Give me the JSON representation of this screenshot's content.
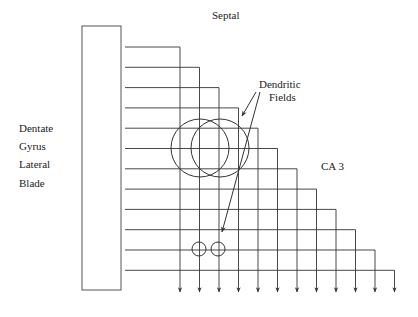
{
  "labels": {
    "septal": "Septal",
    "dentate": "Dentate",
    "gyrus": "Gyrus",
    "lateral": "Lateral",
    "blade": "Blade",
    "ca3": "CA 3",
    "dendritic": "Dendritic",
    "fields": "Fields"
  },
  "diagram": {
    "block": {
      "x": 82,
      "y": 26,
      "w": 39,
      "h": 264
    },
    "line_count": 12,
    "first_line_y": 47,
    "line_spacing_y": 20.3,
    "line_start_x": 125,
    "first_turn_x": 180,
    "turn_spacing_x": 19.5,
    "arrow_tip_y": 292,
    "large_circles": [
      {
        "cx": 200,
        "cy": 148,
        "r": 29
      },
      {
        "cx": 220,
        "cy": 148,
        "r": 29
      }
    ],
    "small_circles": [
      {
        "cx": 199,
        "cy": 249,
        "r": 7
      },
      {
        "cx": 218,
        "cy": 249,
        "r": 7
      }
    ],
    "pointer_arrows": [
      {
        "x1": 256,
        "y1": 92,
        "x2": 242,
        "y2": 116
      },
      {
        "x1": 260,
        "y1": 92,
        "x2": 222,
        "y2": 232
      }
    ],
    "stroke_color": "#333333"
  }
}
